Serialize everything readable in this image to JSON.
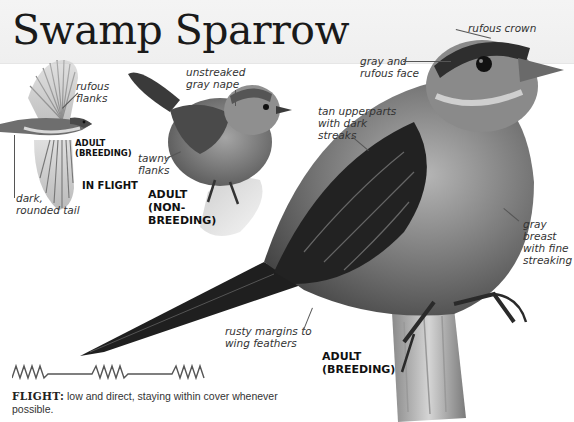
{
  "page": {
    "title": "Swamp Sparrow",
    "colors": {
      "background": "#ffffff",
      "header_band": "#f2f2f2",
      "text": "#222222",
      "leader_line": "#555555"
    }
  },
  "illustrations": {
    "in_flight": {
      "labels": {
        "flanks": "rufous flanks",
        "tail": "dark, rounded tail"
      },
      "plumage_tag": "ADULT (BREEDING)",
      "plumage_tag_line1": "ADULT",
      "plumage_tag_line2": "(BREEDING)",
      "flight_tag": "IN FLIGHT",
      "flanks_line1": "rufous",
      "flanks_line2": "flanks",
      "tail_line1": "dark,",
      "tail_line2": "rounded tail"
    },
    "non_breeding": {
      "nape_line1": "unstreaked",
      "nape_line2": "gray nape",
      "flanks_line1": "tawny",
      "flanks_line2": "flanks",
      "tag_line1": "ADULT",
      "tag_line2": "(NON-",
      "tag_line3": "BREEDING)"
    },
    "breeding": {
      "crown": "rufous crown",
      "face_line1": "gray and",
      "face_line2": "rufous face",
      "upper_line1": "tan upperparts",
      "upper_line2": "with dark",
      "upper_line3": "streaks",
      "breast_line1": "gray",
      "breast_line2": "breast",
      "breast_line3": "with fine",
      "breast_line4": "streaking",
      "wing_line1": "rusty margins to",
      "wing_line2": "wing feathers",
      "tag_line1": "ADULT",
      "tag_line2": "(BREEDING)"
    }
  },
  "flight": {
    "pattern_icon": "flight-pattern-zigzag",
    "heading": "FLIGHT:",
    "text": " low and direct, staying within cover whenever possible."
  }
}
